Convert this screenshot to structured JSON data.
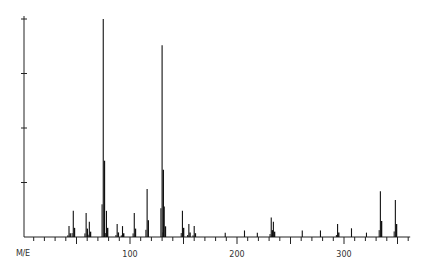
{
  "chart_data": {
    "type": "bar",
    "subtype": "mass-spectrum",
    "title": "",
    "xlabel": "M/E",
    "ylabel": "",
    "x_tick_labels": [
      "100",
      "200",
      "300"
    ],
    "x_tick_values": [
      100,
      200,
      300
    ],
    "xlim": [
      0,
      360
    ],
    "ylim": [
      0,
      100
    ],
    "y_ticks": [
      25,
      50,
      75,
      100
    ],
    "y_tick_labels_visible": false,
    "grid": false,
    "legend": null,
    "peaks": [
      {
        "mz": 43,
        "intensity": 5
      },
      {
        "mz": 47,
        "intensity": 12
      },
      {
        "mz": 59,
        "intensity": 11
      },
      {
        "mz": 62,
        "intensity": 7
      },
      {
        "mz": 75,
        "intensity": 100
      },
      {
        "mz": 78,
        "intensity": 12
      },
      {
        "mz": 88,
        "intensity": 6
      },
      {
        "mz": 93,
        "intensity": 5
      },
      {
        "mz": 104,
        "intensity": 11
      },
      {
        "mz": 116,
        "intensity": 22
      },
      {
        "mz": 130,
        "intensity": 88
      },
      {
        "mz": 132,
        "intensity": 14
      },
      {
        "mz": 149,
        "intensity": 12
      },
      {
        "mz": 155,
        "intensity": 6
      },
      {
        "mz": 160,
        "intensity": 5
      },
      {
        "mz": 189,
        "intensity": 2
      },
      {
        "mz": 207,
        "intensity": 3
      },
      {
        "mz": 219,
        "intensity": 2
      },
      {
        "mz": 232,
        "intensity": 9
      },
      {
        "mz": 234,
        "intensity": 7
      },
      {
        "mz": 261,
        "intensity": 3
      },
      {
        "mz": 278,
        "intensity": 3
      },
      {
        "mz": 294,
        "intensity": 6
      },
      {
        "mz": 307,
        "intensity": 4
      },
      {
        "mz": 321,
        "intensity": 2
      },
      {
        "mz": 334,
        "intensity": 21
      },
      {
        "mz": 348,
        "intensity": 17
      }
    ]
  }
}
